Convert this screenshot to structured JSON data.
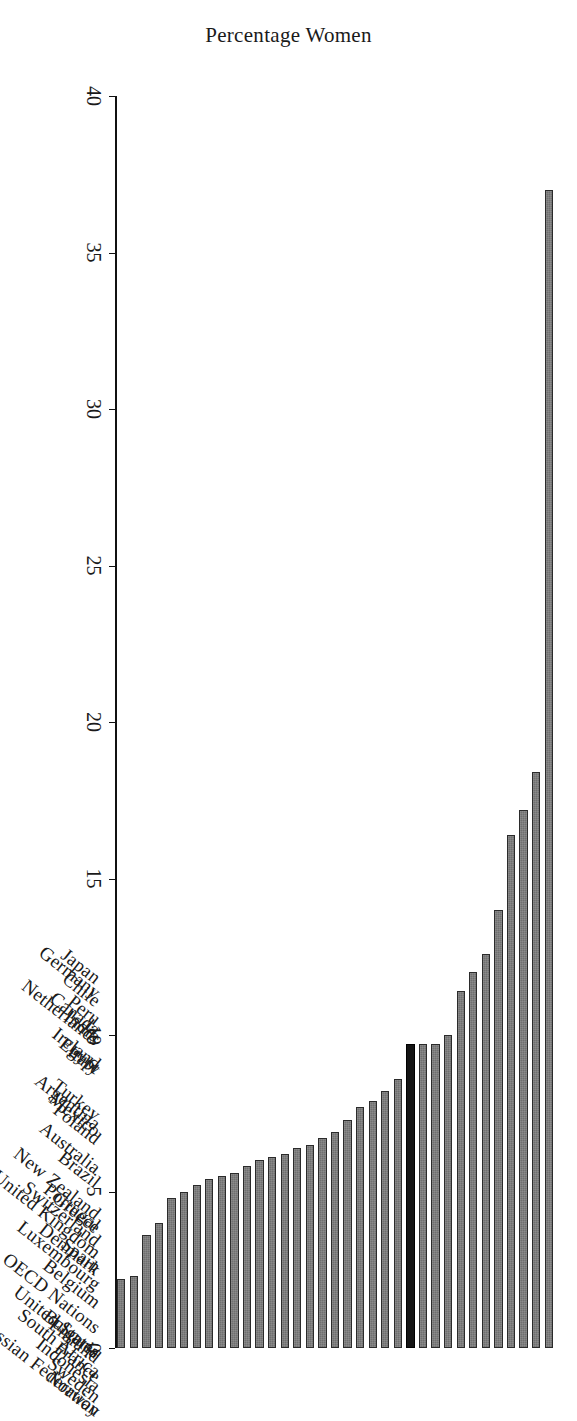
{
  "chart_data": {
    "type": "bar",
    "orientation": "vertical-rendered-rotated",
    "title": "",
    "xlabel": "",
    "ylabel": "Percentage Women",
    "ylim": [
      0,
      40
    ],
    "yticks": [
      0,
      5,
      10,
      15,
      20,
      25,
      30,
      35,
      40
    ],
    "grid": false,
    "legend": null,
    "highlight_category": "OECD Nations",
    "highlight_color": "#151515",
    "bar_color": "#6f6f6f",
    "bar_edge_color": "#2b2b2b",
    "categories": [
      "Norway",
      "Sweden",
      "France",
      "Indonesia",
      "Finland",
      "Bulgaria",
      "South Africa",
      "Russian Federation",
      "United States",
      "Belgium",
      "Spain",
      "OECD Nations",
      "Denmark",
      "Luxembourg",
      "Greece",
      "Portugal",
      "Switzerland",
      "Brazil",
      "United Kingdom",
      "New Zealand",
      "Australia",
      "Poland",
      "Mexico",
      "Turkey",
      "Argentina",
      "Italy",
      "Egypt",
      "Ireland",
      "India",
      "Peru",
      "Canada",
      "Chile",
      "Netherlands",
      "Japan",
      "Germany"
    ],
    "values": [
      37.0,
      18.4,
      17.2,
      16.4,
      14.0,
      12.6,
      12.0,
      11.4,
      10.0,
      9.7,
      9.7,
      9.7,
      8.6,
      8.2,
      7.9,
      7.7,
      7.3,
      6.9,
      6.7,
      6.5,
      6.4,
      6.2,
      6.1,
      6.0,
      5.8,
      5.6,
      5.5,
      5.4,
      5.2,
      5.0,
      4.8,
      4.0,
      3.6,
      2.3,
      2.2
    ],
    "value_unit": "%",
    "note": "Single-series horizontal ranking of percentage of women; OECD Nations bar drawn in black to stand out."
  },
  "axis": {
    "ylabel": "Percentage Women",
    "tick_labels": [
      "0",
      "5",
      "10",
      "15",
      "20",
      "25",
      "30",
      "35",
      "40"
    ]
  }
}
